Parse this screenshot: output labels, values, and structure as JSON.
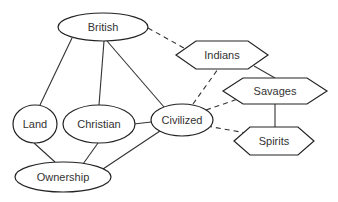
{
  "diagram": {
    "type": "concept-map",
    "colors": {
      "stroke": "#222222",
      "text": "#333333",
      "background": "#ffffff"
    },
    "nodes": [
      {
        "id": "british",
        "label": "British",
        "shape": "ellipse",
        "cx": 103,
        "cy": 27,
        "rx": 45,
        "ry": 14
      },
      {
        "id": "indians",
        "label": "Indians",
        "shape": "hexagon",
        "cx": 222,
        "cy": 55,
        "w": 92,
        "h": 28
      },
      {
        "id": "savages",
        "label": "Savages",
        "shape": "hexagon",
        "cx": 275,
        "cy": 91,
        "w": 104,
        "h": 26
      },
      {
        "id": "land",
        "label": "Land",
        "shape": "ellipse",
        "cx": 35,
        "cy": 124,
        "rx": 22,
        "ry": 19
      },
      {
        "id": "christian",
        "label": "Christian",
        "shape": "ellipse",
        "cx": 99,
        "cy": 124,
        "rx": 36,
        "ry": 19
      },
      {
        "id": "civilized",
        "label": "Civilized",
        "shape": "ellipse",
        "cx": 182,
        "cy": 120,
        "rx": 31,
        "ry": 16
      },
      {
        "id": "spirits",
        "label": "Spirits",
        "shape": "hexagon",
        "cx": 274,
        "cy": 141,
        "w": 80,
        "h": 28
      },
      {
        "id": "ownership",
        "label": "Ownership",
        "shape": "ellipse",
        "cx": 63,
        "cy": 177,
        "rx": 48,
        "ry": 15
      }
    ],
    "edges": [
      {
        "from": "british",
        "to": "land",
        "style": "solid"
      },
      {
        "from": "british",
        "to": "christian",
        "style": "solid"
      },
      {
        "from": "british",
        "to": "civilized",
        "style": "solid"
      },
      {
        "from": "british",
        "to": "indians",
        "style": "dashed"
      },
      {
        "from": "christian",
        "to": "civilized",
        "style": "solid"
      },
      {
        "from": "land",
        "to": "ownership",
        "style": "solid"
      },
      {
        "from": "christian",
        "to": "ownership",
        "style": "solid"
      },
      {
        "from": "civilized",
        "to": "ownership",
        "style": "solid"
      },
      {
        "from": "civilized",
        "to": "indians",
        "style": "dashed"
      },
      {
        "from": "civilized",
        "to": "savages",
        "style": "dashed"
      },
      {
        "from": "civilized",
        "to": "spirits",
        "style": "dashed"
      },
      {
        "from": "indians",
        "to": "savages",
        "style": "solid"
      },
      {
        "from": "savages",
        "to": "spirits",
        "style": "solid"
      }
    ]
  }
}
